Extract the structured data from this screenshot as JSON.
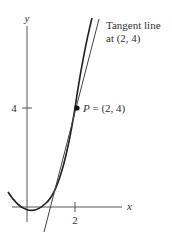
{
  "diagram": {
    "axes": {
      "x_label": "x",
      "y_label": "y",
      "x_tick_label": "2",
      "y_tick_label": "4"
    },
    "curve": {
      "name": "parabola",
      "equation": "y = x^2"
    },
    "tangent": {
      "label_line1": "Tangent line",
      "label_line2": "at (2, 4)",
      "slope": 4,
      "point": [
        2,
        4
      ]
    },
    "point": {
      "name": "P",
      "label_rest": " = (2, 4)"
    },
    "colors": {
      "ink": "#333333",
      "background": "#ffffff"
    }
  }
}
